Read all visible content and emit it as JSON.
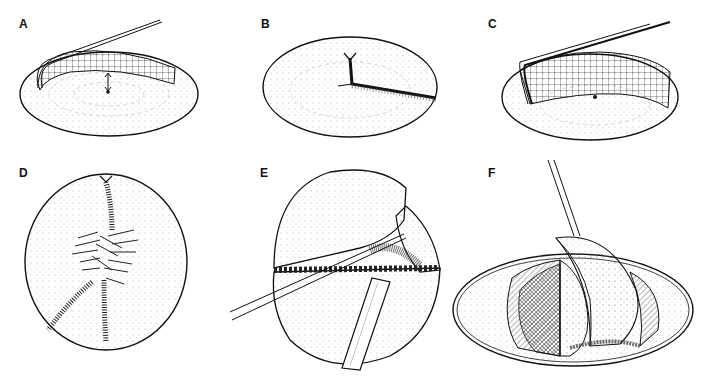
{
  "figure": {
    "panels": [
      {
        "id": "A",
        "label": "A",
        "description": "Lens-shaped disc with a grid-marked retractor lifting a flap; arrow pointing to center dot"
      },
      {
        "id": "B",
        "label": "B",
        "description": "Lens-shaped disc with a radial incision from rim notch to center and out to the right edge"
      },
      {
        "id": "C",
        "label": "C",
        "description": "Lens-shaped disc with grid-marked retractor lifting a larger flap; center dot"
      },
      {
        "id": "D",
        "label": "D",
        "description": "Circular disc viewed from above with three radial cuts and a feathered central region"
      },
      {
        "id": "E",
        "label": "E",
        "description": "Sphere split horizontally, with a thin probe and a wide spatula inserted into the seam"
      },
      {
        "id": "F",
        "label": "F",
        "description": "Shallow dish containing hemispherical segments fanned apart, with a probe from above"
      }
    ],
    "colors": {
      "ink": "#111111",
      "stipple": "#9a9a9a",
      "background": "#ffffff"
    }
  }
}
